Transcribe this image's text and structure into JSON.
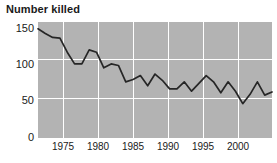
{
  "chart_data": {
    "type": "line",
    "title": "Number killed",
    "xlabel": "",
    "ylabel": "",
    "ylim": [
      0,
      150
    ],
    "xlim": [
      1972,
      2004
    ],
    "grid": true,
    "legend": "none",
    "yticks": [
      0,
      50,
      100,
      150
    ],
    "ytick_labels": [
      "0",
      "50",
      "100",
      "150"
    ],
    "xticks": [
      1975,
      1980,
      1985,
      1990,
      1995,
      2000
    ],
    "xtick_labels": [
      "1975",
      "1980",
      "1985",
      "1990",
      "1995",
      "2000"
    ],
    "x": [
      1972,
      1973,
      1974,
      1975,
      1976,
      1977,
      1978,
      1979,
      1980,
      1981,
      1982,
      1983,
      1984,
      1985,
      1986,
      1987,
      1988,
      1989,
      1990,
      1991,
      1992,
      1993,
      1994,
      1995,
      1996,
      1997,
      1998,
      1999,
      2000,
      2001,
      2002,
      2003,
      2004
    ],
    "values": [
      140,
      134,
      129,
      128,
      110,
      95,
      95,
      113,
      110,
      90,
      95,
      93,
      72,
      75,
      80,
      67,
      82,
      74,
      63,
      63,
      72,
      60,
      70,
      80,
      72,
      58,
      72,
      60,
      44,
      56,
      72,
      55,
      59
    ],
    "series_color": "#262626",
    "plot_background": "#b3b3b3",
    "gridline_color": "#ffffff"
  },
  "axis": {
    "y_label_0": "0",
    "y_label_50": "50",
    "y_label_100": "100",
    "y_label_150": "150",
    "x_label_1975": "1975",
    "x_label_1980": "1980",
    "x_label_1985": "1985",
    "x_label_1990": "1990",
    "x_label_1995": "1995",
    "x_label_2000": "2000"
  }
}
